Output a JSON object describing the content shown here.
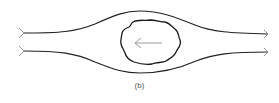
{
  "figure": {
    "caption": "(b)",
    "colors": {
      "streamline": "#222222",
      "body_outline": "#1a1a1a",
      "inner_arrow": "#999999",
      "arrowheads": "#888888",
      "caption": "#555555"
    },
    "elements": {
      "streamlines": [
        {
          "label": "upper-streamline",
          "direction": "left-to-right"
        },
        {
          "label": "lower-streamline",
          "direction": "left-to-right"
        }
      ],
      "body": {
        "label": "irregular-body"
      },
      "inner_arrow": {
        "label": "leftward-arrow",
        "direction": "right-to-left"
      }
    }
  }
}
